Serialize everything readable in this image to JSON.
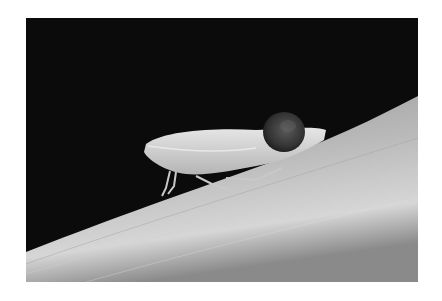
{
  "image": {
    "subject": "leafhopper insect on a grass leaf blade",
    "description": "Grayscale macro photograph of a pale leafhopper perched on a diagonal leaf, carrying a dark round sphere on its back, against a black background",
    "colors": {
      "background": "#0b0b0b",
      "leaf_dark": "#6e6e6e",
      "leaf_light": "#c8c8c8",
      "insect": "#d9d9d9",
      "sphere": "#3a3a3a"
    }
  }
}
